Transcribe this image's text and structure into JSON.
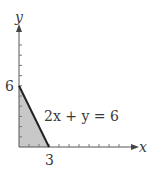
{
  "chart_data": {
    "type": "area",
    "title": "",
    "xlabel": "x",
    "ylabel": "y",
    "equation_label": "2x + y = 6",
    "line": {
      "equation": "2x + y = 6",
      "points": [
        [
          0,
          6
        ],
        [
          3,
          0
        ]
      ]
    },
    "shaded_region": {
      "description": "Feasible region bounded by x >= 0, y >= 0, 2x + y <= 6",
      "vertices": [
        [
          0,
          0
        ],
        [
          0,
          6
        ],
        [
          3,
          0
        ]
      ]
    },
    "x_tick_labels": [
      {
        "value": 3,
        "label": "3"
      }
    ],
    "y_tick_labels": [
      {
        "value": 6,
        "label": "6"
      }
    ],
    "xlim": [
      0,
      11.5
    ],
    "ylim": [
      0,
      12
    ],
    "grid": false,
    "legend": null,
    "colors": {
      "shade": "#c8c8c8",
      "line": "#222222",
      "axis": "#555555",
      "text": "#3a3a3a"
    }
  },
  "labels": {
    "x_axis": "x",
    "y_axis": "y",
    "x_tick": "3",
    "y_tick": "6",
    "equation": "2x + y = 6"
  }
}
